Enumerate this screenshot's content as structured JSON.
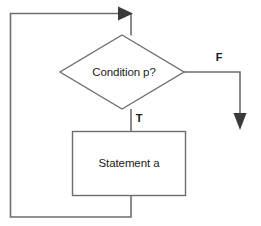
{
  "diagram": {
    "type": "flowchart",
    "canvas": {
      "width": 261,
      "height": 226,
      "background": "#ffffff"
    },
    "colors": {
      "line": "#6e6e6e",
      "arrow": "#3a3a3a",
      "text": "#1a1a1a",
      "shape_fill": "#ffffff"
    },
    "nodes": [
      {
        "id": "condition",
        "shape": "diamond",
        "label": "Condition p?",
        "cx": 122,
        "cy": 72,
        "half_width": 62,
        "half_height": 37
      },
      {
        "id": "statement",
        "shape": "rectangle",
        "label": "Statement a",
        "x": 72,
        "y": 131,
        "width": 114,
        "height": 65,
        "cx": 129,
        "cy": 163
      }
    ],
    "branch_labels": [
      {
        "id": "true-label",
        "text": "T",
        "x": 139,
        "y": 119
      },
      {
        "id": "false-label",
        "text": "F",
        "x": 219,
        "y": 58
      }
    ],
    "edges": [
      {
        "id": "entry-to-condition",
        "from": "loop-back",
        "to": "condition",
        "path": "M 131 13 L 131 35"
      },
      {
        "id": "condition-true-to-statement",
        "from": "condition",
        "to": "statement",
        "label": "T",
        "path": "M 131 109 L 131 131"
      },
      {
        "id": "condition-false-exit",
        "from": "condition",
        "to": "exit",
        "label": "F",
        "path": "M 184 72 L 240 72 L 240 118"
      },
      {
        "id": "statement-loop-back",
        "from": "statement",
        "to": "entry",
        "path": "M 131 196 L 131 216 L 10 216 L 10 13 L 118 13"
      }
    ],
    "arrowheads": [
      {
        "id": "loop-back-arrowhead",
        "direction": "right",
        "x": 131,
        "y": 13
      },
      {
        "id": "exit-arrowhead",
        "direction": "down",
        "x": 240,
        "y": 127
      }
    ]
  }
}
